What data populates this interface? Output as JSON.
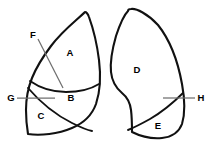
{
  "figure": {
    "background_color": "#ffffff",
    "outline_color": "#111111",
    "leader_color": "#6f6f6f",
    "label_color": "#000000",
    "width": 213,
    "height": 151
  },
  "lobe_labels": [
    {
      "id": "A",
      "text": "A",
      "x": 70,
      "y": 53
    },
    {
      "id": "B",
      "text": "B",
      "x": 71,
      "y": 98
    },
    {
      "id": "C",
      "text": "C",
      "x": 41,
      "y": 116
    },
    {
      "id": "D",
      "text": "D",
      "x": 137,
      "y": 70
    },
    {
      "id": "E",
      "text": "E",
      "x": 158,
      "y": 126
    }
  ],
  "callouts": [
    {
      "id": "F",
      "text": "F",
      "x": 33,
      "y": 35
    },
    {
      "id": "G",
      "text": "G",
      "x": 11,
      "y": 98
    },
    {
      "id": "H",
      "text": "H",
      "x": 201,
      "y": 98
    }
  ]
}
